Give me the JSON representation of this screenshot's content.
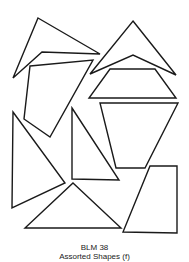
{
  "page": {
    "title_line": "BLM 38",
    "subtitle_line": "Assorted Shapes (f)"
  },
  "style": {
    "stroke": "#1a1a1a",
    "fill": "#ffffff",
    "stroke_width": 1.4
  },
  "shapes": [
    {
      "name": "dart-top-left",
      "points": "38,18 100,54 42,52 13,78"
    },
    {
      "name": "quadrilateral-upper-left",
      "points": "30,66 93,60 50,137 24,119"
    },
    {
      "name": "dart-top-right",
      "points": "133,21 176,75 133,55 90,74"
    },
    {
      "name": "trapezoid-upper-right",
      "points": "110,69 155,69 176,98 89,98"
    },
    {
      "name": "inverted-trapezoid-right",
      "points": "100,103 178,103 145,168 116,168"
    },
    {
      "name": "triangle-left",
      "points": "13,112 65,183 12,208"
    },
    {
      "name": "right-triangle-middle",
      "points": "72,108 119,180 72,179"
    },
    {
      "name": "triangle-bottom",
      "points": "73,183 121,228 25,228"
    },
    {
      "name": "quadrilateral-bottom-right",
      "points": "150,166 177,166 177,233 123,232"
    }
  ]
}
